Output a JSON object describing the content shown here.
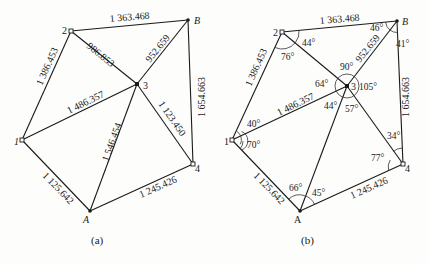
{
  "figure_a": {
    "caption": "(a)",
    "points": {
      "p1": "1",
      "p2": "2",
      "p3": "3",
      "p4": "4",
      "pA": "A",
      "pB": "B"
    },
    "edges": {
      "e2B": "1 363.468",
      "e21": "1 386.453",
      "e23": "986.853",
      "e3B": "952.659",
      "eB4": "1 654.663",
      "e13": "1 486.357",
      "e3A": "1 546.454",
      "e34": "1 123.450",
      "e1A": "1 125.642",
      "eA4": "1 245.426"
    }
  },
  "figure_b": {
    "caption": "(b)",
    "points": {
      "p1": "1",
      "p2": "2",
      "p3": "3",
      "p4": "4",
      "pA": "A",
      "pB": "B"
    },
    "edges": {
      "e2B": "1 363.468",
      "e21": "1 386.453",
      "e3B": "952.659",
      "eB4": "1 654.663",
      "e13": "1 486.357",
      "e1A": "1 125.642",
      "eA4": "1 245.426"
    },
    "angles": {
      "a2_upper": "44°",
      "a2_lower": "76°",
      "aB_left": "46°",
      "aB_right": "41°",
      "a3_top": "90°",
      "a3_left": "64°",
      "a3_right": "105°",
      "a3_lowleft": "44°",
      "a3_lowright": "57°",
      "a1_upper": "40°",
      "a1_lower": "70°",
      "a4_upper": "34°",
      "a4_lower": "77°",
      "aA_left": "66°",
      "aA_right": "45°"
    }
  }
}
